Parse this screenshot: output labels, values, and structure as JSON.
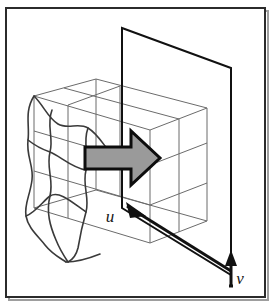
{
  "figure": {
    "kind": "technical-line-diagram",
    "background_color": "#ffffff",
    "border": {
      "name": "figure-border",
      "color": "#2b2b2b",
      "shadow_color": "#9e9e9e",
      "x": 6,
      "y": 8,
      "width": 259,
      "height": 289,
      "stroke_width": 2
    },
    "labels": [
      {
        "name": "axis-label-u",
        "text": "u",
        "x": 110,
        "y": 222,
        "style": "italic-serif",
        "color": "#161616"
      },
      {
        "name": "axis-label-v",
        "text": "v",
        "x": 236,
        "y": 283,
        "style": "italic-serif",
        "color": "#161616"
      }
    ],
    "axes": [
      {
        "name": "u-axis",
        "label": "u",
        "from": [
          127,
          206
        ],
        "to": [
          231,
          271
        ],
        "arrow_at": "start",
        "color": "#111111",
        "stroke_width": 3
      },
      {
        "name": "v-axis",
        "label": "v",
        "from": [
          231,
          285
        ],
        "to": [
          231,
          252
        ],
        "arrow_at": "end",
        "color": "#111111",
        "stroke_width": 3
      }
    ],
    "plane": {
      "name": "reference-plane",
      "description": "vertical transparent plane seen edge-on in perspective",
      "color": "#111111",
      "stroke_width": 2,
      "fill": "none",
      "points": [
        [
          122,
          28
        ],
        [
          231,
          68
        ],
        [
          231,
          275
        ],
        [
          122,
          208
        ]
      ]
    },
    "box": {
      "name": "wireframe-box",
      "description": "thin wireframe cube subdivided by one interior grid line per face",
      "color": "#6b6b6b",
      "stroke_width": 1,
      "fill": "none"
    },
    "blob": {
      "name": "deformed-object",
      "description": "wavy deformed left portion of the wireframe box",
      "color": "#3a3a3a",
      "stroke_width": 1.6,
      "fill": "#ffffff"
    },
    "arrow": {
      "name": "force-arrow",
      "description": "thick block arrow pointing right from object into the plane",
      "fill_color": "#9a9a9a",
      "stroke_color": "#0d0d0d",
      "stroke_width": 3,
      "direction": "right",
      "points": [
        [
          85,
          147
        ],
        [
          131,
          147
        ],
        [
          131,
          131
        ],
        [
          160,
          158
        ],
        [
          131,
          185
        ],
        [
          131,
          169
        ],
        [
          85,
          169
        ]
      ]
    }
  }
}
